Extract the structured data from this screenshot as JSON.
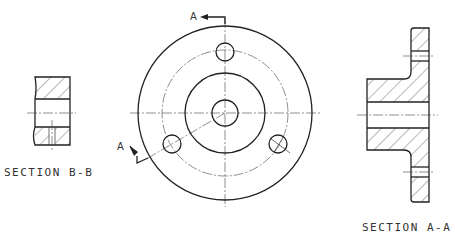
{
  "drawing": {
    "title": "Flange technical drawing",
    "views": {
      "section_bb": {
        "label": "SECTION  B-B"
      },
      "front_view": {
        "cutting_plane_label_top": "A",
        "cutting_plane_label_left": "A",
        "bolt_hole_count": 3
      },
      "section_aa": {
        "label": "SECTION  A-A"
      }
    }
  }
}
